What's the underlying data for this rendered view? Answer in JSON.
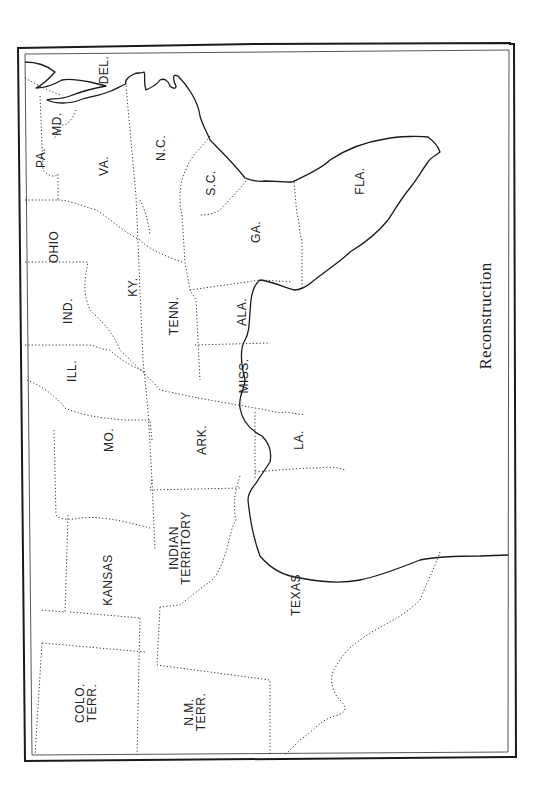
{
  "map": {
    "title": "Reconstruction",
    "orientation": "rotated 90 degrees clockwise (north to the left)",
    "labels": {
      "pa": "PA.",
      "md": "MD.",
      "del": "DEL.",
      "va": "VA.",
      "nc": "N.C.",
      "sc": "S.C.",
      "ga": "GA.",
      "fla": "FLA.",
      "ohio": "OHIO",
      "ind": "IND.",
      "ky": "KY.",
      "tenn": "TENN.",
      "ala": "ALA.",
      "ill": "ILL.",
      "miss": "MISS.",
      "mo": "MO.",
      "ark": "ARK.",
      "la": "LA.",
      "kansas": "KANSAS",
      "indian_1": "INDIAN",
      "indian_2": "TERRITORY",
      "texas": "TEXAS",
      "colo_1": "COLO.",
      "colo_2": "TERR.",
      "nm_1": "N.M.",
      "nm_2": "TERR."
    }
  }
}
